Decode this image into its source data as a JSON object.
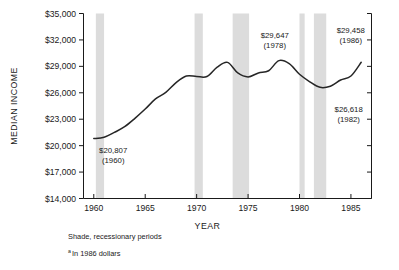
{
  "chart_data": {
    "type": "line",
    "title": "",
    "xlabel": "YEAR",
    "ylabel": "MEDIAN INCOME",
    "xlim": [
      1959,
      1987
    ],
    "ylim": [
      14000,
      35000
    ],
    "grid": false,
    "legend_position": "none",
    "y_ticks": [
      "$14,000",
      "$17,000",
      "$20,000",
      "$23,000",
      "$26,000",
      "$29,000",
      "$32,000",
      "$35,000"
    ],
    "y_tick_values": [
      14000,
      17000,
      20000,
      23000,
      26000,
      29000,
      32000,
      35000
    ],
    "x_ticks": [
      "1960",
      "1965",
      "1970",
      "1975",
      "1980",
      "1985"
    ],
    "x_tick_values": [
      1960,
      1965,
      1970,
      1975,
      1980,
      1985
    ],
    "series": [
      {
        "name": "Median income (1986 dollars)",
        "color": "#262626",
        "x": [
          1960,
          1961,
          1962,
          1963,
          1964,
          1965,
          1966,
          1967,
          1968,
          1969,
          1970,
          1971,
          1972,
          1973,
          1974,
          1975,
          1976,
          1977,
          1978,
          1979,
          1980,
          1981,
          1982,
          1983,
          1984,
          1985,
          1986
        ],
        "values": [
          20807,
          20950,
          21500,
          22150,
          23100,
          24150,
          25300,
          26050,
          27150,
          27900,
          27850,
          27850,
          28900,
          29450,
          28250,
          27800,
          28250,
          28500,
          29647,
          29300,
          28100,
          27250,
          26618,
          26750,
          27450,
          27900,
          29458
        ]
      }
    ],
    "annotations": [
      {
        "label": "$20,807",
        "year_label": "(1960)",
        "x": 1960,
        "y": 20807,
        "value": 20807
      },
      {
        "label": "$29,647",
        "year_label": "(1978)",
        "x": 1978,
        "y": 29647,
        "value": 29647
      },
      {
        "label": "$26,618",
        "year_label": "(1982)",
        "x": 1982,
        "y": 26618,
        "value": 26618
      },
      {
        "label": "$29,458",
        "year_label": "(1986)",
        "x": 1986,
        "y": 29458,
        "value": 29458
      }
    ],
    "shaded_bands": {
      "description": "Shade, recessionary periods",
      "color": "#dcdcdc",
      "ranges": [
        {
          "start": 1960.2,
          "end": 1961.0
        },
        {
          "start": 1969.8,
          "end": 1970.6
        },
        {
          "start": 1973.5,
          "end": 1975.1
        },
        {
          "start": 1980.0,
          "end": 1980.5
        },
        {
          "start": 1981.4,
          "end": 1982.6
        }
      ]
    }
  },
  "footnotes": {
    "shade_note": "Shade, recessionary periods",
    "dollars_marker": "a",
    "dollars_note": "In 1986 dollars"
  }
}
